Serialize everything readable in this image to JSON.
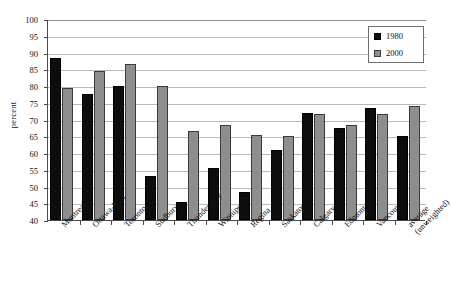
{
  "chart_data": {
    "type": "bar",
    "title": "",
    "xlabel": "",
    "ylabel": "percent",
    "ylim": [
      40,
      100
    ],
    "ytick_step": 5,
    "yticks": [
      100,
      95,
      90,
      85,
      80,
      75,
      70,
      65,
      60,
      55,
      50,
      45,
      40
    ],
    "grid": true,
    "legend_position": "top-right",
    "categories": [
      "Montreal",
      "Ottawa-Hull",
      "Toronto",
      "Sudbury",
      "Thunder Bay",
      "Winnipeg",
      "Regina",
      "Saskatoon",
      "Calgary",
      "Edmonton",
      "Vancouver",
      "average (unweighted)"
    ],
    "category_lines": [
      [
        "Montreal"
      ],
      [
        "Ottawa-Hull"
      ],
      [
        "Toronto"
      ],
      [
        "Sudbury"
      ],
      [
        "Thunder Bay"
      ],
      [
        "Winnipeg"
      ],
      [
        "Regina"
      ],
      [
        "Saskatoon"
      ],
      [
        "Calgary"
      ],
      [
        "Edmonton"
      ],
      [
        "Vancouver"
      ],
      [
        "average",
        "(unweighted)"
      ]
    ],
    "series": [
      {
        "name": "1980",
        "color": "#0d0d0d",
        "values": [
          88.5,
          77.5,
          80.0,
          53.0,
          45.5,
          55.5,
          48.5,
          61.0,
          72.0,
          67.5,
          73.5,
          65.0
        ]
      },
      {
        "name": "2000",
        "color": "#8e8e8e",
        "values": [
          79.5,
          84.5,
          86.5,
          80.0,
          66.5,
          68.5,
          65.5,
          65.0,
          71.5,
          68.5,
          71.5,
          74.0
        ]
      }
    ]
  },
  "legend": {
    "items": [
      {
        "label": "1980",
        "swatch": "black-square"
      },
      {
        "label": "2000",
        "swatch": "gray-square"
      }
    ]
  }
}
